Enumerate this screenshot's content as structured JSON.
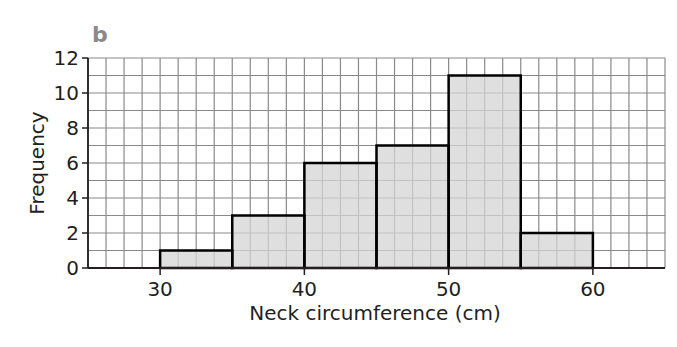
{
  "panel_label": "b",
  "chart_data": {
    "type": "bar",
    "subtype": "histogram",
    "title": "",
    "xlabel": "Neck circumference (cm)",
    "ylabel": "Frequency",
    "xlim": [
      25,
      65
    ],
    "ylim": [
      0,
      12
    ],
    "x_ticks": [
      30,
      40,
      50,
      60
    ],
    "y_ticks": [
      0,
      2,
      4,
      6,
      8,
      10,
      12
    ],
    "x_tick_labels": [
      "30",
      "40",
      "50",
      "60"
    ],
    "y_tick_labels": [
      "0",
      "2",
      "4",
      "6",
      "8",
      "10",
      "12"
    ],
    "grid": true,
    "grid_x_step": 1.25,
    "grid_y_step": 1,
    "categories": [
      "30-35",
      "35-40",
      "40-45",
      "45-50",
      "50-55",
      "55-60"
    ],
    "bins": [
      [
        30,
        35
      ],
      [
        35,
        40
      ],
      [
        40,
        45
      ],
      [
        45,
        50
      ],
      [
        50,
        55
      ],
      [
        55,
        60
      ]
    ],
    "values": [
      1,
      3,
      6,
      7,
      11,
      2
    ],
    "bar_fill": "#d4d4d4",
    "bar_edge": "#000000",
    "grid_color": "#8a8a8a",
    "legend": null
  }
}
